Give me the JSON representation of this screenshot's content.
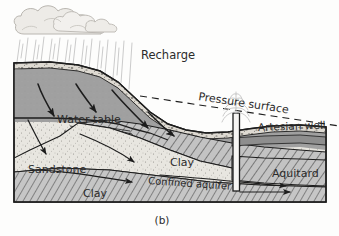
{
  "figure": {
    "caption": "(b)",
    "kind": "hydrogeology-cross-section"
  },
  "labels": {
    "recharge": "Recharge",
    "pressure_surface": "Pressure surface",
    "artesian_well": "Artesian well",
    "water_table": "Water table",
    "sandstone": "Sandstone",
    "clay_upper": "Clay",
    "clay_lower": "Clay",
    "confined_aquifer": "Confined aquifer",
    "aquitard": "Aquitard"
  },
  "icons": {
    "cloud": "cloud-icon",
    "rain": "rain-icon",
    "well_spray": "water-spray-icon",
    "flow_arrow": "flow-arrow-icon"
  },
  "colors": {
    "soil_speckle": "#cfcac2",
    "saturated_zone": "#9d9d9d",
    "sandstone": "#e6e4de",
    "clay_hatch_fill": "#bdbdbd",
    "line": "#1d1d1d",
    "text": "#2b2b2b",
    "cloud": "#eceae6",
    "rain": "#d6d6d6",
    "well_pipe": "#f4f4f2",
    "background": "#fdfdfc"
  }
}
